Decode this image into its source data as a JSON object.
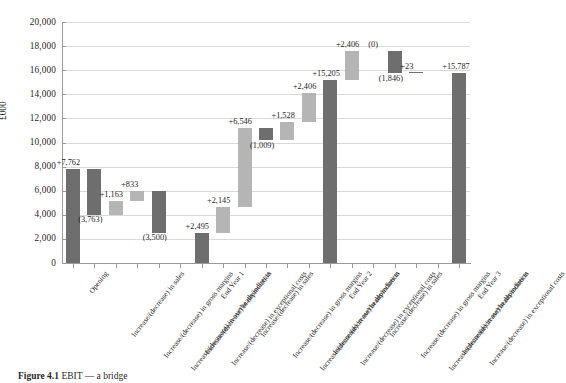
{
  "figure": {
    "caption_prefix": "Figure 4.1",
    "caption_text": "EBIT — a bridge"
  },
  "axes": {
    "y_title": "£000",
    "y_ticks": [
      "20,000",
      "18,000",
      "16,000",
      "14,000",
      "12,000",
      "10,000",
      "8,000",
      "6,000",
      "4,000",
      "2,000",
      "0"
    ],
    "y_min": 0,
    "y_max": 20000,
    "y_step": 2000
  },
  "chart_data": {
    "type": "bar",
    "subtype": "waterfall",
    "title": "",
    "xlabel": "",
    "ylabel": "£000",
    "ylim": [
      0,
      20000
    ],
    "ystep": 2000,
    "grid": true,
    "legend": "none",
    "colors": {
      "decrease_or_total": "#6e6e6e",
      "increase": "#b5b5b5",
      "gridline": "#d9d9d9",
      "axis": "#9a9a9a"
    },
    "categories": [
      "Opening",
      "Increase/(decrease) in sales",
      "Increase/(decrease) in gross margins",
      "Increase/(decrease) in overheads/indirects",
      "Increase/(decrease) in depreciation",
      "Increase/(decrease) in exceptional costs",
      "End Year 1",
      "Increase/(decrease) in sales",
      "Increase/(decrease) in gross margins",
      "Increase/(decrease) in overheads/indirects",
      "Increase/(decrease) in depreciation",
      "Increase/(decrease) in exceptional costs",
      "End Year 2",
      "Increase/(decrease) in sales",
      "Increase/(decrease) in gross margins",
      "Increase/(decrease) in overheads/indirects",
      "Increase/(decrease) in depreciation",
      "Increase/(decrease) in exceptional costs",
      "End Year 3"
    ],
    "labels": [
      "+7,762",
      "(3,763)",
      "+1,163",
      "+833",
      "(3,500)",
      "+2,495",
      "+15,205",
      "+2,145",
      "+6,546",
      "(1,009)",
      "+1,528",
      "+2,406",
      "+15,205",
      "+2,406",
      "(0)",
      "(1,846)",
      "+23",
      "+15,787",
      "+15,787"
    ],
    "bars": [
      {
        "label": "+7,762",
        "value": 7762,
        "kind": "total",
        "base": 0,
        "top": 7762,
        "color": "#6e6e6e"
      },
      {
        "label": "(3,763)",
        "value": -3763,
        "kind": "decrease",
        "base": 3999,
        "top": 7762,
        "color": "#6e6e6e"
      },
      {
        "label": "+1,163",
        "value": 1163,
        "kind": "increase",
        "base": 3999,
        "top": 5162,
        "color": "#b5b5b5"
      },
      {
        "label": "+833",
        "value": 833,
        "kind": "increase",
        "base": 5162,
        "top": 5995,
        "color": "#b5b5b5"
      },
      {
        "label": "(3,500)",
        "value": -3500,
        "kind": "decrease",
        "base": 2495,
        "top": 5995,
        "color": "#6e6e6e"
      },
      {
        "label": "+2,495",
        "value": 2495,
        "kind": "total",
        "base": 0,
        "top": 2495,
        "color": "#6e6e6e"
      },
      {
        "label": "+2,145",
        "value": 2145,
        "kind": "increase",
        "base": 2495,
        "top": 4640,
        "color": "#b5b5b5"
      },
      {
        "label": "+6,546",
        "value": 6546,
        "kind": "increase",
        "base": 4640,
        "top": 11186,
        "color": "#b5b5b5"
      },
      {
        "label": "(1,009)",
        "value": -1009,
        "kind": "decrease",
        "base": 10177,
        "top": 11186,
        "color": "#6e6e6e"
      },
      {
        "label": "+1,528",
        "value": 1528,
        "kind": "increase",
        "base": 10177,
        "top": 11705,
        "color": "#b5b5b5"
      },
      {
        "label": "+2,406",
        "value": 2406,
        "kind": "increase",
        "base": 11705,
        "top": 14111,
        "color": "#b5b5b5"
      },
      {
        "label": "+15,205",
        "value": 15205,
        "kind": "total",
        "base": 0,
        "top": 15205,
        "color": "#6e6e6e"
      },
      {
        "label": "+2,406",
        "value": 2406,
        "kind": "increase",
        "base": 15205,
        "top": 17611,
        "color": "#b5b5b5"
      },
      {
        "label": "(0)",
        "value": 0,
        "kind": "zero",
        "base": 17611,
        "top": 17611,
        "color": "#6e6e6e"
      },
      {
        "label": "(1,846)",
        "value": -1846,
        "kind": "decrease",
        "base": 15765,
        "top": 17611,
        "color": "#6e6e6e"
      },
      {
        "label": "+23",
        "value": 23,
        "kind": "increase",
        "base": 15765,
        "top": 15788,
        "color": "#6e6e6e"
      },
      {
        "label": "+15,787",
        "value": 15787,
        "kind": "total",
        "base": 0,
        "top": 15787,
        "color": "#6e6e6e"
      }
    ]
  }
}
